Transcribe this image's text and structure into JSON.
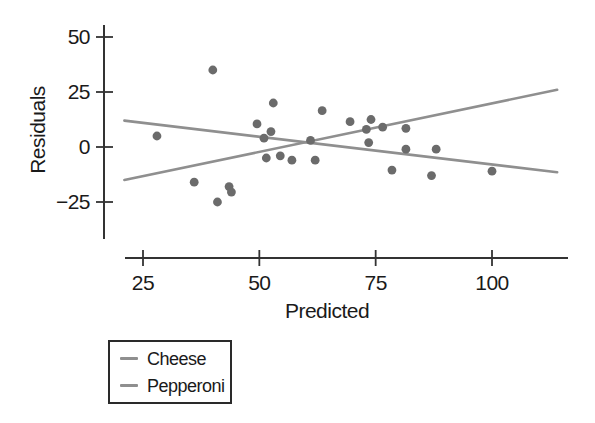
{
  "chart_data": {
    "type": "scatter",
    "title": "",
    "xlabel": "Predicted",
    "ylabel": "Residuals",
    "xticks": [
      25,
      50,
      75,
      100
    ],
    "yticks": [
      50,
      25,
      0,
      -25
    ],
    "xlim": [
      20,
      116
    ],
    "ylim": [
      -42,
      56
    ],
    "grid": false,
    "axis_color": "#333333",
    "text_color": "#1a1a1a",
    "point_color": "#6b6b6b",
    "point_radius": 4.4,
    "points": [
      [
        28,
        5
      ],
      [
        36,
        -16
      ],
      [
        40,
        35
      ],
      [
        41,
        -25
      ],
      [
        43.5,
        -18
      ],
      [
        44,
        -20.5
      ],
      [
        49.5,
        10.5
      ],
      [
        51,
        4
      ],
      [
        51.5,
        -5
      ],
      [
        52.5,
        7
      ],
      [
        53,
        20
      ],
      [
        54.5,
        -4
      ],
      [
        57,
        -6
      ],
      [
        61,
        3
      ],
      [
        62,
        -6
      ],
      [
        63.5,
        16.5
      ],
      [
        69.5,
        11.5
      ],
      [
        73,
        8
      ],
      [
        73.5,
        2
      ],
      [
        74,
        12.5
      ],
      [
        76.5,
        9
      ],
      [
        78.5,
        -10.5
      ],
      [
        81.5,
        8.5
      ],
      [
        81.5,
        -1
      ],
      [
        87,
        -13
      ],
      [
        88,
        -1
      ],
      [
        100,
        -11
      ]
    ],
    "series": [
      {
        "name": "Cheese",
        "type": "trend-line",
        "color": "#8f8f8f",
        "endpoints": [
          [
            21,
            12
          ],
          [
            114,
            -11.5
          ]
        ]
      },
      {
        "name": "Pepperoni",
        "type": "trend-line",
        "color": "#8f8f8f",
        "endpoints": [
          [
            21,
            -15
          ],
          [
            114,
            26
          ]
        ]
      }
    ],
    "legend": {
      "position": "bottom-left",
      "entries": [
        "Cheese",
        "Pepperoni"
      ]
    }
  }
}
